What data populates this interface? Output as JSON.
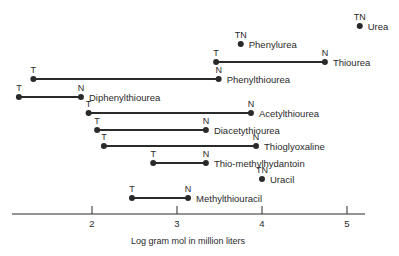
{
  "chart_data": {
    "type": "range-dot",
    "title": "",
    "xlabel": "Log gram mol in million liters",
    "ylabel": "",
    "xlim": [
      1.0,
      5.2
    ],
    "xticks": [
      2,
      3,
      4,
      5
    ],
    "grid": false,
    "legend": null,
    "marker_legend": {
      "T": "T endpoint",
      "N": "N endpoint",
      "TN": "T and N coincide"
    },
    "series": [
      {
        "name": "Urea",
        "T": 5.15,
        "N": 5.15,
        "row": 0
      },
      {
        "name": "Phenylurea",
        "T": 3.75,
        "N": 3.75,
        "row": 1
      },
      {
        "name": "Thiourea",
        "T": 3.46,
        "N": 4.74,
        "row": 2
      },
      {
        "name": "Phenylthiourea",
        "T": 1.31,
        "N": 3.49,
        "row": 3
      },
      {
        "name": "Diphenylthiourea",
        "T": 1.14,
        "N": 1.87,
        "row": 4
      },
      {
        "name": "Acetylthiourea",
        "T": 1.96,
        "N": 3.87,
        "row": 5
      },
      {
        "name": "Diacetythiourea",
        "T": 2.06,
        "N": 3.34,
        "row": 6
      },
      {
        "name": "Thioglyoxaline",
        "T": 2.14,
        "N": 3.93,
        "row": 7
      },
      {
        "name": "Thio-methylhydantoin",
        "T": 2.72,
        "N": 3.34,
        "row": 8
      },
      {
        "name": "Uracil",
        "T": 4.0,
        "N": 4.0,
        "row": 9
      },
      {
        "name": "Methylthiouracil",
        "T": 2.47,
        "N": 3.13,
        "row": 10
      }
    ]
  },
  "layout": {
    "row_y": [
      26,
      44,
      62,
      79,
      97,
      113,
      130,
      146,
      163,
      179,
      198
    ],
    "axis_y": 214,
    "axis_x0": 12,
    "axis_x1": 365,
    "px_at_2": 92,
    "px_per_unit": 85
  },
  "colors": {
    "ink": "#2a2a2a",
    "background": "#ffffff"
  }
}
